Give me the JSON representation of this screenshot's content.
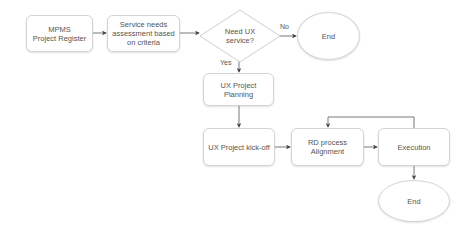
{
  "diagram": {
    "type": "flowchart",
    "nodes": {
      "mpms": {
        "label": "MPMS\nProject Register",
        "shape": "rounded-rect"
      },
      "service": {
        "label": "Service needs assessment based on criteria",
        "shape": "rounded-rect"
      },
      "decision": {
        "label": "Need UX service?",
        "shape": "diamond"
      },
      "end_top": {
        "label": "End",
        "shape": "oval"
      },
      "planning": {
        "label": "UX Project Planning",
        "shape": "rounded-rect"
      },
      "kickoff": {
        "label": "UX Project kick-off",
        "shape": "rounded-rect"
      },
      "rd": {
        "label": "RD process Alignment",
        "shape": "rounded-rect"
      },
      "execution": {
        "label": "Execution",
        "shape": "rounded-rect"
      },
      "end_bottom": {
        "label": "End",
        "shape": "oval"
      }
    },
    "edges": [
      {
        "from": "mpms",
        "to": "service",
        "label": ""
      },
      {
        "from": "service",
        "to": "decision",
        "label": ""
      },
      {
        "from": "decision",
        "to": "end_top",
        "label": "No"
      },
      {
        "from": "decision",
        "to": "planning",
        "label": "Yes"
      },
      {
        "from": "planning",
        "to": "kickoff",
        "label": ""
      },
      {
        "from": "kickoff",
        "to": "rd",
        "label": ""
      },
      {
        "from": "rd",
        "to": "execution",
        "label": ""
      },
      {
        "from": "execution",
        "to": "rd",
        "label": ""
      },
      {
        "from": "execution",
        "to": "end_bottom",
        "label": ""
      }
    ],
    "edge_labels": {
      "no": "No",
      "yes": "Yes"
    },
    "colors": {
      "stroke": "#d4d4d4",
      "arrow": "#444444",
      "text": "#555555",
      "background": "#ffffff"
    }
  }
}
